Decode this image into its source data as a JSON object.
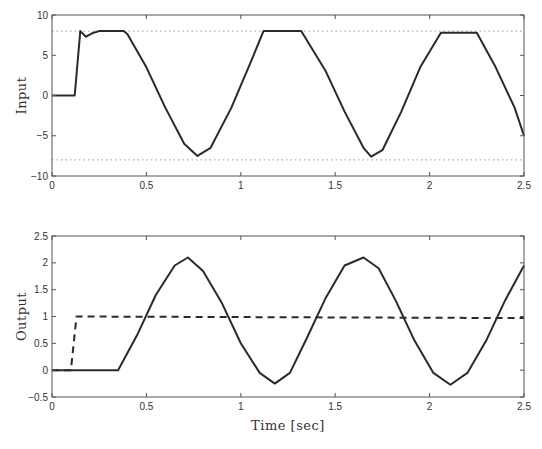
{
  "chart_data": [
    {
      "type": "line",
      "title": "",
      "xlabel": "",
      "ylabel": "Input",
      "xlim": [
        0,
        2.5
      ],
      "ylim": [
        -10,
        10
      ],
      "xticks": [
        "0",
        "0.5",
        "1",
        "1.5",
        "2",
        "2.5"
      ],
      "yticks": [
        "-10",
        "-5",
        "0",
        "5",
        "10"
      ],
      "grid": false,
      "reference_lines": [
        {
          "name": "upper saturation",
          "y": 8,
          "style": "dotted"
        },
        {
          "name": "lower saturation",
          "y": -8,
          "style": "dotted"
        }
      ],
      "series": [
        {
          "name": "input",
          "style": "solid",
          "x": [
            0,
            0.12,
            0.15,
            0.18,
            0.22,
            0.25,
            0.38,
            0.4,
            0.5,
            0.6,
            0.7,
            0.77,
            0.84,
            0.95,
            1.05,
            1.12,
            1.32,
            1.45,
            1.55,
            1.65,
            1.69,
            1.75,
            1.85,
            1.95,
            2.06,
            2.25,
            2.35,
            2.45,
            2.5
          ],
          "y": [
            0,
            0,
            8,
            7.3,
            7.8,
            8,
            8,
            7.6,
            3.5,
            -1.5,
            -6,
            -7.5,
            -6.5,
            -1.5,
            4,
            8,
            8,
            3,
            -2,
            -6.5,
            -7.6,
            -6.8,
            -2,
            3.5,
            7.8,
            7.8,
            3.5,
            -1.5,
            -5
          ]
        }
      ]
    },
    {
      "type": "line",
      "title": "",
      "xlabel": "Time [sec]",
      "ylabel": "Output",
      "xlim": [
        0,
        2.5
      ],
      "ylim": [
        -0.5,
        2.5
      ],
      "xticks": [
        "0",
        "0.5",
        "1",
        "1.5",
        "2",
        "2.5"
      ],
      "yticks": [
        "-0.5",
        "0",
        "0.5",
        "1",
        "1.5",
        "2",
        "2.5"
      ],
      "grid": false,
      "series": [
        {
          "name": "output",
          "style": "solid",
          "x": [
            0,
            0.35,
            0.45,
            0.55,
            0.65,
            0.72,
            0.8,
            0.9,
            1.0,
            1.1,
            1.18,
            1.26,
            1.35,
            1.45,
            1.55,
            1.65,
            1.73,
            1.82,
            1.92,
            2.02,
            2.11,
            2.2,
            2.3,
            2.4,
            2.5
          ],
          "y": [
            0,
            0,
            0.65,
            1.4,
            1.95,
            2.1,
            1.85,
            1.25,
            0.5,
            -0.05,
            -0.25,
            -0.05,
            0.6,
            1.35,
            1.95,
            2.1,
            1.9,
            1.3,
            0.55,
            -0.05,
            -0.27,
            -0.05,
            0.55,
            1.3,
            1.95
          ]
        },
        {
          "name": "reference",
          "style": "dashed",
          "x": [
            0,
            0.1,
            0.13,
            2.5
          ],
          "y": [
            0,
            0,
            1,
            0.97
          ]
        }
      ]
    }
  ]
}
